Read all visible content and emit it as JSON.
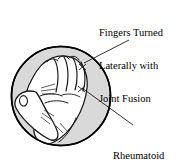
{
  "figure": {
    "name": "rheumatoid-arthritis-hand-figure",
    "type": "medical-illustration",
    "background_color": "#ffffff",
    "circle": {
      "fill_color": "#d9d9d9",
      "stroke_color": "#000000",
      "center_x": 61,
      "center_y": 96,
      "radius": 50
    },
    "hand": {
      "fill_color": "#ffffff",
      "line_color": "#1a1a1a",
      "description": "clenched fist viewed from the back, fingers deviated laterally"
    }
  },
  "callouts": [
    {
      "id": "fingers-turned",
      "lines": [
        "Fingers Turned",
        "Laterally with",
        "Joint Fusion"
      ],
      "leader_line": {
        "from_x": 129,
        "from_y": 40,
        "to_x": 84,
        "to_y": 63
      }
    },
    {
      "id": "rheumatoid-nodules",
      "lines": [
        "Rheumatoid",
        "Nodules"
      ],
      "leader_line": {
        "from_x": 133,
        "from_y": 125,
        "to_x": 82,
        "to_y": 88
      }
    }
  ],
  "colors": {
    "text": "#000000",
    "leader": "#1a1a1a",
    "circle_fill": "#d9d9d9",
    "hand_fill": "#ffffff",
    "outline": "#000000"
  }
}
